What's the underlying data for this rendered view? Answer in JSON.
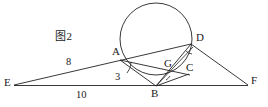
{
  "figure": {
    "caption": "图2",
    "type": "geometry-diagram",
    "canvas": {
      "width": 268,
      "height": 107
    },
    "stroke_color": "#222222",
    "background_color": "#ffffff"
  },
  "circle": {
    "label": "circumscribed-circle",
    "cx": 156,
    "cy": 39,
    "r": 36
  },
  "points": [
    {
      "name": "E",
      "label": "E",
      "x": 14,
      "y": 85,
      "label_x": 5,
      "label_y": 78
    },
    {
      "name": "A",
      "label": "A",
      "x": 120,
      "y": 60,
      "label_x": 113,
      "label_y": 48
    },
    {
      "name": "B",
      "label": "B",
      "x": 156,
      "y": 86,
      "label_x": 152,
      "label_y": 88
    },
    {
      "name": "G",
      "label": "G",
      "x": 172,
      "y": 70,
      "label_x": 165,
      "label_y": 60
    },
    {
      "name": "C",
      "label": "C",
      "x": 189,
      "y": 74,
      "label_x": 187,
      "label_y": 63
    },
    {
      "name": "D",
      "label": "D",
      "x": 191,
      "y": 44,
      "label_x": 195,
      "label_y": 33
    },
    {
      "name": "F",
      "label": "F",
      "x": 248,
      "y": 85,
      "label_x": 252,
      "label_y": 77
    }
  ],
  "segments": [
    {
      "name": "EA",
      "from": "E",
      "to": "A"
    },
    {
      "name": "AD",
      "from": "A",
      "to": "D"
    },
    {
      "name": "EB",
      "from": "E",
      "to": "B"
    },
    {
      "name": "BF",
      "from": "B",
      "to": "F"
    },
    {
      "name": "DF",
      "from": "D",
      "to": "F"
    },
    {
      "name": "AB",
      "from": "A",
      "to": "B"
    },
    {
      "name": "AC",
      "from": "A",
      "to": "C"
    },
    {
      "name": "BD",
      "from": "B",
      "to": "D"
    },
    {
      "name": "BG",
      "from": "B",
      "to": "G"
    },
    {
      "name": "GD",
      "from": "G",
      "to": "D"
    }
  ],
  "length_labels": [
    {
      "name": "EA-length",
      "text": "8",
      "x": 67,
      "y": 60,
      "for": "EA"
    },
    {
      "name": "AB-length",
      "text": "3",
      "x": 118,
      "y": 74,
      "for": "AB"
    },
    {
      "name": "EB-length",
      "text": "10",
      "x": 77,
      "y": 91,
      "for": "EB"
    }
  ],
  "angle_marks": [
    {
      "name": "angle-mark-at-A",
      "cx": 120,
      "cy": 60,
      "note": "arc between AB and AE"
    },
    {
      "name": "angle-mark-at-B",
      "cx": 156,
      "cy": 86,
      "note": "arc between BD and BG"
    },
    {
      "name": "angle-mark-at-D",
      "cx": 191,
      "cy": 44,
      "note": "arc near D"
    }
  ]
}
